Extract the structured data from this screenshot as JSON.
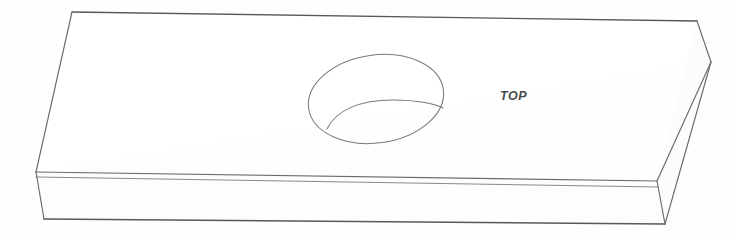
{
  "drawing": {
    "title": "Isometric rectangular block with circular blind hole",
    "background_color": "#fefefe",
    "line_color": "#6b6b6b",
    "label_color": "#4a4a4a",
    "canvas": {
      "width": 736,
      "height": 239
    },
    "labels": [
      {
        "name": "top-face-label",
        "text": "TOP",
        "x": 500,
        "y": 100
      }
    ],
    "geometry": {
      "top_face": {
        "name": "top-face",
        "vertices": "72,12 697,21 711,62 36,172"
      },
      "front_face": {
        "name": "front-face",
        "vertices": "36,177 658,187 665,224 44,219"
      },
      "front_top_strip": {
        "name": "front-chamfer-strip",
        "vertices": "36,172 657,181 658,187 36,177"
      },
      "end_face": {
        "name": "right-end-face",
        "vertices": "697,21 711,62 665,224 658,187 657,181"
      },
      "edges": [
        {
          "name": "top-back-edge",
          "d": "M 72 12 L 697 21"
        },
        {
          "name": "top-left-edge",
          "d": "M 72 12 L 36 172"
        },
        {
          "name": "top-front-edge",
          "d": "M 36 172 L 657 181"
        },
        {
          "name": "top-right-edge",
          "d": "M 697 21 L 711 62"
        },
        {
          "name": "top-front-right-edge",
          "d": "M 711 62 L 657 181"
        },
        {
          "name": "front-upper-edge",
          "d": "M 36 177 L 658 187"
        },
        {
          "name": "front-bottom-edge",
          "d": "M 44 219 L 665 224"
        },
        {
          "name": "front-left-edge",
          "d": "M 36 172 L 44 219"
        },
        {
          "name": "end-right-edge",
          "d": "M 711 62 L 665 224"
        },
        {
          "name": "end-inner-edge",
          "d": "M 657 181 L 665 224"
        }
      ],
      "hole": {
        "name": "blind-hole",
        "center_x": 376,
        "center_y": 99,
        "rx": 68,
        "ry": 44,
        "rotation": -8,
        "inner_arc": "M 327 129 C 336 110, 360 100, 393 100 C 418 100, 436 104, 443 108"
      }
    }
  }
}
